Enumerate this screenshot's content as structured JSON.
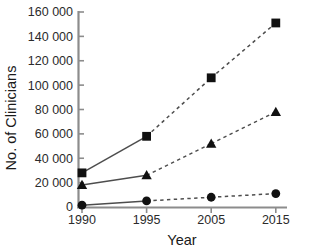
{
  "chart_data": {
    "type": "line",
    "title": "",
    "xlabel": "Year",
    "ylabel": "No. of Clinicians",
    "categories": [
      "1990",
      "1995",
      "2005",
      "2015"
    ],
    "xtick_labels": [
      "1990",
      "1995",
      "2005",
      "2015"
    ],
    "ytick_labels": [
      "0",
      "20 000",
      "40 000",
      "60 000",
      "80 000",
      "100 000",
      "120 000",
      "140 000",
      "160 000"
    ],
    "ytick_values": [
      0,
      20000,
      40000,
      60000,
      80000,
      100000,
      120000,
      140000,
      160000
    ],
    "ylim": [
      0,
      160000
    ],
    "grid": false,
    "legend": "none",
    "series": [
      {
        "name": "squares",
        "marker": "square",
        "values": [
          28000,
          58000,
          106000,
          151000
        ],
        "line_styles": [
          "solid",
          "dashed",
          "dashed"
        ]
      },
      {
        "name": "triangles",
        "marker": "triangle",
        "values": [
          18000,
          26000,
          52000,
          78000
        ],
        "line_styles": [
          "solid",
          "dashed",
          "dashed"
        ]
      },
      {
        "name": "circles",
        "marker": "circle",
        "values": [
          1500,
          5000,
          8000,
          11000
        ],
        "line_styles": [
          "solid",
          "dashed",
          "dashed"
        ]
      }
    ],
    "colors": {
      "marker": "#111111",
      "line": "#4d4d4d",
      "axis": "#8c8c8c",
      "text": "#1a1a1a",
      "background": "#ffffff"
    }
  }
}
